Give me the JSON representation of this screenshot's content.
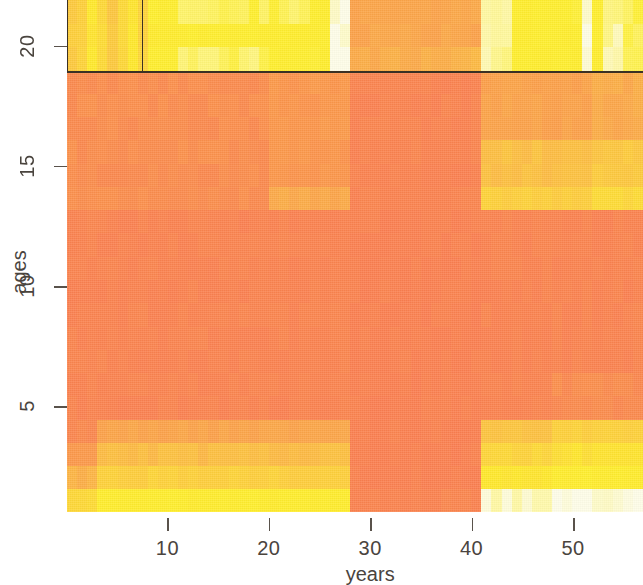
{
  "figure": {
    "type": "heatmap",
    "x_axis_title": "years",
    "y_axis_title": "ages",
    "x_ticks": [
      {
        "label": "10",
        "value": 10
      },
      {
        "label": "20",
        "value": 20
      },
      {
        "label": "30",
        "value": 30
      },
      {
        "label": "40",
        "value": 40
      },
      {
        "label": "50",
        "value": 50
      }
    ],
    "y_ticks": [
      {
        "label": "5",
        "value": 5
      },
      {
        "label": "10",
        "value": 10
      },
      {
        "label": "15",
        "value": 15
      },
      {
        "label": "20",
        "value": 20
      }
    ],
    "colors": {
      "background_orange": "#fb8050",
      "mid_orange": "#fb8a4e",
      "light_orange": "#fca84e",
      "amber": "#fdc council",
      "yellow": "#ffef2e",
      "pale_yellow": "#fff9b8",
      "near_white": "#fefde8",
      "annotation_stroke": "#3b3124",
      "tick_color": "#59524b",
      "label_color": "#4a443e"
    },
    "annotations": [
      {
        "name": "selection-rectangle",
        "x0": 0.1,
        "x1": 7.6,
        "y0": 18.9,
        "y1": 21.9
      },
      {
        "name": "horizontal-divider",
        "y": 18.9,
        "x0": 0.1,
        "x1": 56.9
      }
    ]
  },
  "chart_data": {
    "type": "heatmap",
    "title": "",
    "xlabel": "years",
    "ylabel": "ages",
    "xlim": [
      0.1,
      56.9
    ],
    "ylim": [
      0.6,
      21.9
    ],
    "grid": false,
    "legend": null,
    "colorscale": [
      "#fb7a52",
      "#fb8a4e",
      "#fca84e",
      "#fdc04a",
      "#ffe03a",
      "#ffef2e",
      "#fff9b8",
      "#fefde8"
    ],
    "x_ticks": [
      10,
      20,
      30,
      40,
      50
    ],
    "y_ticks": [
      5,
      10,
      15,
      20
    ],
    "bands": [
      {
        "name": "top-yellow-band",
        "age_range": [
          18.9,
          21.9
        ],
        "note": "high values, yellow to near-white"
      },
      {
        "name": "orange-vertical-band",
        "year_range": [
          28.2,
          41.4
        ],
        "note": "low values across all ages"
      },
      {
        "name": "mid-age-light-band",
        "age_range": [
          12.8,
          18.9
        ],
        "note": "moderate values, stronger on right"
      },
      {
        "name": "low-age-band",
        "age_range": [
          0.6,
          4.4
        ],
        "note": "moderate to high values outside the orange band"
      }
    ]
  }
}
